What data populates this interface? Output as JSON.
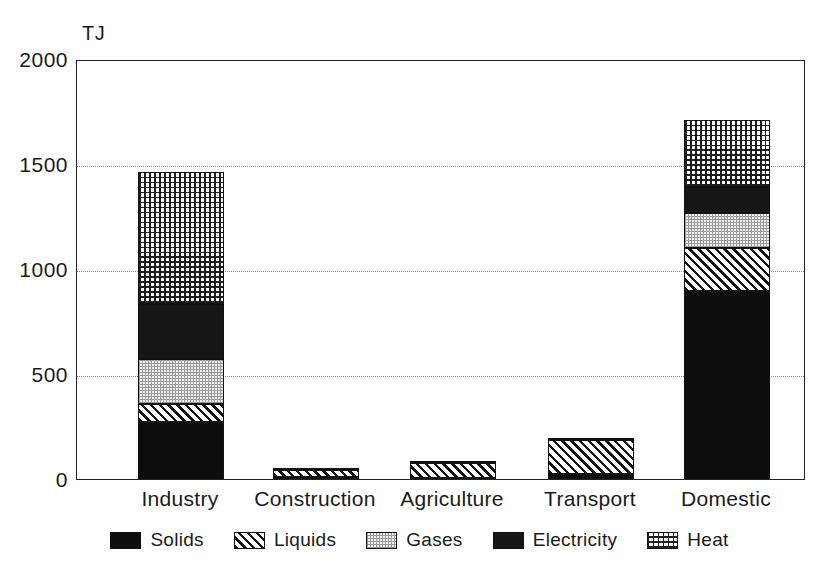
{
  "chart_data": {
    "type": "bar",
    "subtype": "stacked-bar",
    "title": "",
    "xlabel": "",
    "ylabel": "TJ",
    "unit": "TJ",
    "ylim": [
      0,
      2000
    ],
    "yticks": [
      0,
      500,
      1000,
      1500,
      2000
    ],
    "ytick_labels": [
      "0",
      "500",
      "1000",
      "1500",
      "2000"
    ],
    "grid": true,
    "grid_axis": "y",
    "legend_position": "bottom",
    "categories": [
      "Industry",
      "Construction",
      "Agriculture",
      "Transport",
      "Domestic"
    ],
    "series": [
      {
        "name": "Solids",
        "pattern": "solid-black",
        "values": [
          270,
          10,
          5,
          25,
          895
        ]
      },
      {
        "name": "Liquids",
        "pattern": "diagonal-hatch",
        "values": [
          85,
          35,
          70,
          160,
          205
        ]
      },
      {
        "name": "Gases",
        "pattern": "fine-dots",
        "values": [
          215,
          0,
          0,
          0,
          165
        ]
      },
      {
        "name": "Electricity",
        "pattern": "solid-dark",
        "values": [
          265,
          5,
          10,
          10,
          125
        ]
      },
      {
        "name": "Heat",
        "pattern": "cross-hatch",
        "values": [
          625,
          0,
          0,
          0,
          320
        ]
      }
    ],
    "totals": [
      1460,
      50,
      85,
      195,
      1710
    ]
  },
  "axis": {
    "unit_label": "TJ"
  },
  "legend": {
    "items": [
      {
        "label": "Solids",
        "icon": "swatch-solid-black"
      },
      {
        "label": "Liquids",
        "icon": "swatch-diagonal-hatch"
      },
      {
        "label": "Gases",
        "icon": "swatch-fine-dots"
      },
      {
        "label": "Electricity",
        "icon": "swatch-solid-dark"
      },
      {
        "label": "Heat",
        "icon": "swatch-cross-hatch"
      }
    ]
  },
  "colors": {
    "solids": "#0d0d0d",
    "liquids": "#111111",
    "gases": "#9a9a9a",
    "electricity": "#161616",
    "heat": "#1d1d1d",
    "axis": "#222222",
    "grid": "#8d8d8d",
    "background": "#ffffff"
  }
}
